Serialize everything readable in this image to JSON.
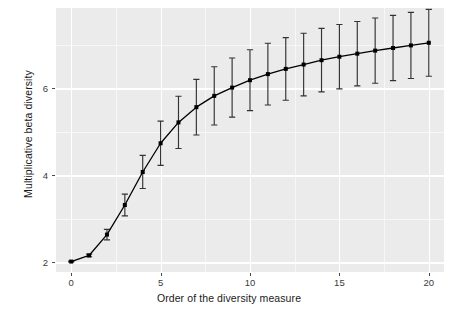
{
  "chart_data": {
    "type": "line",
    "title": "",
    "subtitle": "",
    "xlabel": "Order of the diversity measure",
    "ylabel": "Multiplicative beta diversity",
    "xlim": [
      -0.85,
      20.85
    ],
    "ylim": [
      1.78,
      7.85
    ],
    "xticks": [
      0,
      5,
      10,
      15,
      20
    ],
    "xtick_labels": [
      "0",
      "5",
      "10",
      "15",
      "20"
    ],
    "yticks": [
      2,
      4,
      6
    ],
    "ytick_labels": [
      "2",
      "4",
      "6"
    ],
    "x_minor_ticks": [
      2.5,
      7.5,
      12.5,
      17.5
    ],
    "y_minor_ticks": [
      3,
      5,
      7
    ],
    "grid": true,
    "legend": null,
    "errorbars": true,
    "marker": "filled-square",
    "x": [
      0,
      1,
      2,
      3,
      4,
      5,
      6,
      7,
      8,
      9,
      10,
      11,
      12,
      13,
      14,
      15,
      16,
      17,
      18,
      19,
      20
    ],
    "values": [
      2.02,
      2.16,
      2.64,
      3.32,
      4.08,
      4.74,
      5.22,
      5.57,
      5.83,
      6.02,
      6.19,
      6.33,
      6.45,
      6.55,
      6.65,
      6.73,
      6.8,
      6.87,
      6.93,
      6.99,
      7.05
    ],
    "error_low": [
      2.01,
      2.13,
      2.52,
      3.07,
      3.7,
      4.23,
      4.62,
      4.93,
      5.16,
      5.34,
      5.49,
      5.62,
      5.73,
      5.83,
      5.92,
      5.99,
      6.06,
      6.12,
      6.18,
      6.23,
      6.28
    ],
    "error_high": [
      2.03,
      2.19,
      2.76,
      3.57,
      4.46,
      5.25,
      5.82,
      6.21,
      6.5,
      6.7,
      6.89,
      7.04,
      7.17,
      7.27,
      7.38,
      7.47,
      7.54,
      7.62,
      7.68,
      7.75,
      7.82
    ],
    "series": [
      {
        "name": "Multiplicative beta diversity",
        "values": [
          2.02,
          2.16,
          2.64,
          3.32,
          4.08,
          4.74,
          5.22,
          5.57,
          5.83,
          6.02,
          6.19,
          6.33,
          6.45,
          6.55,
          6.65,
          6.73,
          6.8,
          6.87,
          6.93,
          6.99,
          7.05
        ]
      }
    ],
    "colors": {
      "line": "#000000",
      "marker": "#000000",
      "errorbar": "#333333",
      "panel_background": "#ebebeb",
      "grid_major": "#ffffff",
      "grid_minor": "#f7f7f7",
      "text": "#1a1a1a"
    }
  }
}
